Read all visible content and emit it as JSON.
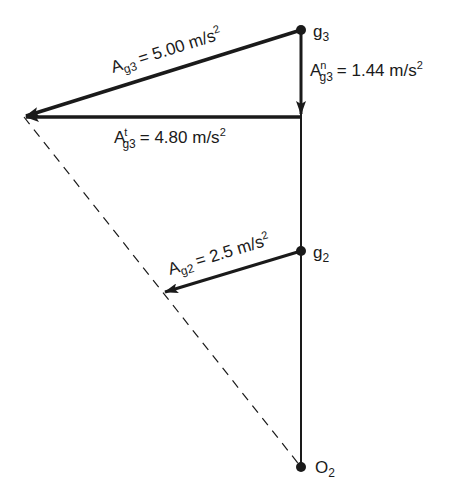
{
  "diagram": {
    "type": "acceleration-vector-diagram",
    "points": {
      "g3": {
        "label": "g",
        "sub": "3"
      },
      "g2": {
        "label": "g",
        "sub": "2"
      },
      "O2": {
        "label": "O",
        "sub": "2"
      }
    },
    "vectors": {
      "Ag3": {
        "main": "A",
        "sub": "g3",
        "sup": "",
        "value": "= 5.00 m/s",
        "exp": "2"
      },
      "Ag3n": {
        "main": "A",
        "sub": "g3",
        "sup": "n",
        "value": "= 1.44 m/s",
        "exp": "2"
      },
      "Ag3t": {
        "main": "A",
        "sub": "g3",
        "sup": "t",
        "value": "= 4.80 m/s",
        "exp": "2"
      },
      "Ag2": {
        "main": "A",
        "sub": "g2",
        "sup": "",
        "value": "= 2.5 m/s",
        "exp": "2"
      }
    },
    "colors": {
      "ink": "#1a1a1a",
      "background": "#ffffff"
    }
  }
}
